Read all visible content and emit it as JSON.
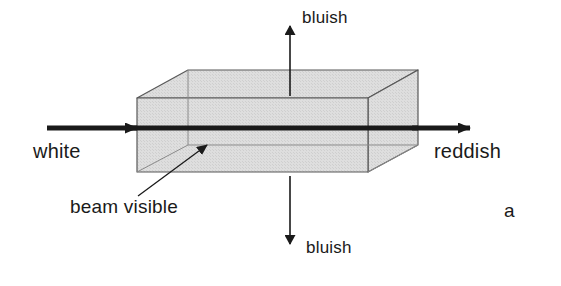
{
  "figure": {
    "panel_label": "a",
    "background_color": "#ffffff",
    "ink_color": "#1a1a1a",
    "box_fill_color": "#d9d9d9",
    "box_edge_color": "#555555"
  },
  "labels": {
    "incident_beam": "white",
    "transmitted_beam": "reddish",
    "scattered_up": "bluish",
    "scattered_down": "bluish",
    "beam_callout": "beam visible"
  },
  "diagram": {
    "type": "light-scattering-schematic",
    "medium_shape": "rectangular-box",
    "beam_axis": "horizontal",
    "beam_direction": "left-to-right",
    "scattering_directions": [
      "up",
      "down"
    ]
  },
  "geometry": {
    "box": {
      "front_top_left": [
        137,
        98
      ],
      "front_top_right": [
        368,
        98
      ],
      "front_bottom_left": [
        137,
        172
      ],
      "front_bottom_right": [
        368,
        172
      ],
      "back_top_left": [
        188,
        70
      ],
      "back_top_right": [
        418,
        70
      ],
      "back_bottom_left": [
        188,
        145
      ],
      "back_bottom_right": [
        418,
        145
      ]
    },
    "beam": {
      "start_x": 47,
      "end_x": 470,
      "y": 128,
      "thickness": 5
    },
    "arrow_up": {
      "x": 290,
      "tail_y": 96,
      "head_y": 26
    },
    "arrow_down": {
      "x": 290,
      "tail_y": 176,
      "head_y": 244
    },
    "callout_line": {
      "from": [
        138,
        196
      ],
      "to": [
        207,
        145
      ]
    }
  }
}
